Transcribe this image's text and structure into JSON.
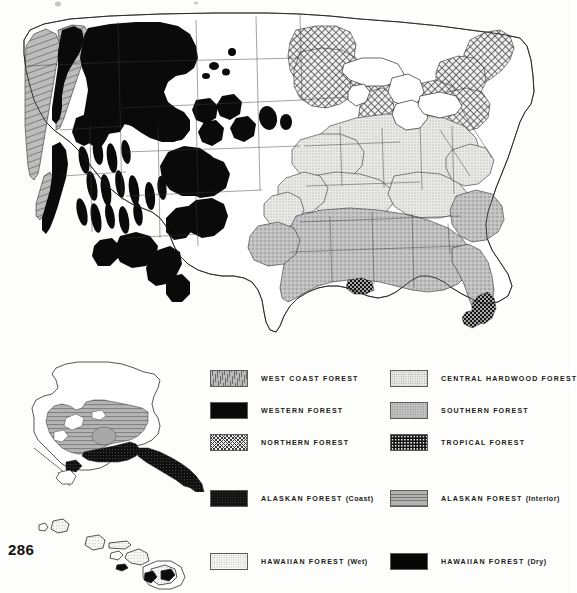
{
  "page": {
    "number": "286"
  },
  "maps": [
    {
      "name": "conterminous-united-states"
    },
    {
      "name": "alaska"
    },
    {
      "name": "hawaii"
    }
  ],
  "legend": {
    "items": [
      {
        "label": "WEST COAST FOREST",
        "qualifier": "",
        "pattern": "pat-westcoast",
        "swatch_name": "swatch-west-coast-forest",
        "column": "left",
        "row": 1
      },
      {
        "label": "WESTERN FOREST",
        "qualifier": "",
        "pattern": "pat-western",
        "swatch_name": "swatch-western-forest",
        "column": "left",
        "row": 2
      },
      {
        "label": "NORTHERN FOREST",
        "qualifier": "",
        "pattern": "pat-northern",
        "swatch_name": "swatch-northern-forest",
        "column": "left",
        "row": 3
      },
      {
        "label": "CENTRAL HARDWOOD FOREST",
        "qualifier": "",
        "pattern": "pat-central",
        "swatch_name": "swatch-central-hardwood-forest",
        "column": "right",
        "row": 1
      },
      {
        "label": "SOUTHERN FOREST",
        "qualifier": "",
        "pattern": "pat-southern",
        "swatch_name": "swatch-southern-forest",
        "column": "right",
        "row": 2
      },
      {
        "label": "TROPICAL FOREST",
        "qualifier": "",
        "pattern": "pat-tropical",
        "swatch_name": "swatch-tropical-forest",
        "column": "right",
        "row": 3
      },
      {
        "label": "ALASKAN FOREST",
        "qualifier": "(Coast)",
        "pattern": "pat-akcoast",
        "swatch_name": "swatch-alaskan-forest-coast",
        "column": "left",
        "row": 4
      },
      {
        "label": "ALASKAN FOREST",
        "qualifier": "(Interior)",
        "pattern": "pat-akinterior",
        "swatch_name": "swatch-alaskan-forest-interior",
        "column": "right",
        "row": 4
      },
      {
        "label": "HAWAIIAN FOREST",
        "qualifier": "(Wet)",
        "pattern": "pat-hiwet",
        "swatch_name": "swatch-hawaiian-forest-wet",
        "column": "left",
        "row": 5
      },
      {
        "label": "HAWAIIAN FOREST",
        "qualifier": "(Dry)",
        "pattern": "pat-hidry",
        "swatch_name": "swatch-hawaiian-forest-dry",
        "column": "right",
        "row": 5
      }
    ]
  },
  "colors": {
    "paper": "#fdfdfb",
    "ink": "#1a1a1a",
    "western_forest": "#0a0a0a",
    "west_coast_forest": "#b9b9b9",
    "northern_forest": "#efefef",
    "central_hardwood_forest": "#e7e7e4",
    "southern_forest": "#bcbcbc",
    "tropical_forest": "#141414",
    "alaskan_forest_coast": "#101010",
    "alaskan_forest_interior": "#b2b2b2",
    "hawaiian_forest_wet": "#f4f4f2",
    "hawaiian_forest_dry": "#070707"
  }
}
